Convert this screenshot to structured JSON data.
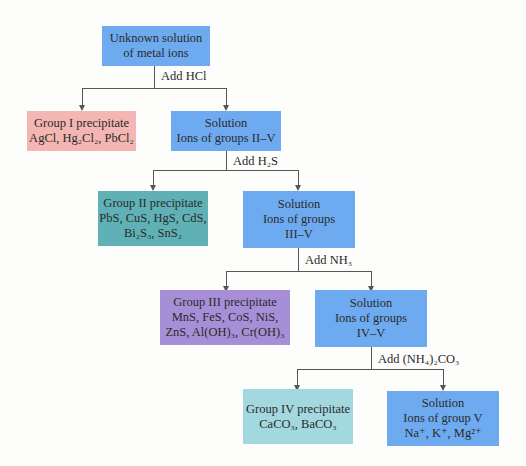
{
  "colors": {
    "solution": "#6eaaf0",
    "group1": "#f3b6b3",
    "group2": "#5fb1b5",
    "group3": "#a78fd8",
    "group4": "#a3d8de",
    "line": "#555555"
  },
  "nodes": {
    "start": {
      "line1": "Unknown solution",
      "line2": "of metal ions"
    },
    "g1": {
      "title": "Group I precipitate",
      "formula": "AgCl, Hg₂Cl₂, PbCl₂"
    },
    "s1": {
      "line1": "Solution",
      "line2": "Ions of groups II–V"
    },
    "g2": {
      "title": "Group II precipitate",
      "line2": "PbS, CuS, HgS, CdS,",
      "line3": "Bi₂S₃, SnS₂"
    },
    "s2": {
      "line1": "Solution",
      "line2": "Ions of groups",
      "line3": "III–V"
    },
    "g3": {
      "title": "Group III precipitate",
      "line2": "MnS, FeS, CoS, NiS,",
      "line3": "ZnS, Al(OH)₃, Cr(OH)₃"
    },
    "s3": {
      "line1": "Solution",
      "line2": "Ions of groups",
      "line3": "IV–V"
    },
    "g4": {
      "title": "Group IV precipitate",
      "line2": "CaCO₃, BaCO₃"
    },
    "s4": {
      "line1": "Solution",
      "line2": "Ions of group V",
      "line3": "Na⁺, K⁺, Mg²⁺"
    }
  },
  "reagents": {
    "r1": "Add HCl",
    "r2": "Add H₂S",
    "r3": "Add NH₃",
    "r4": "Add (NH₄)₂CO₃"
  }
}
